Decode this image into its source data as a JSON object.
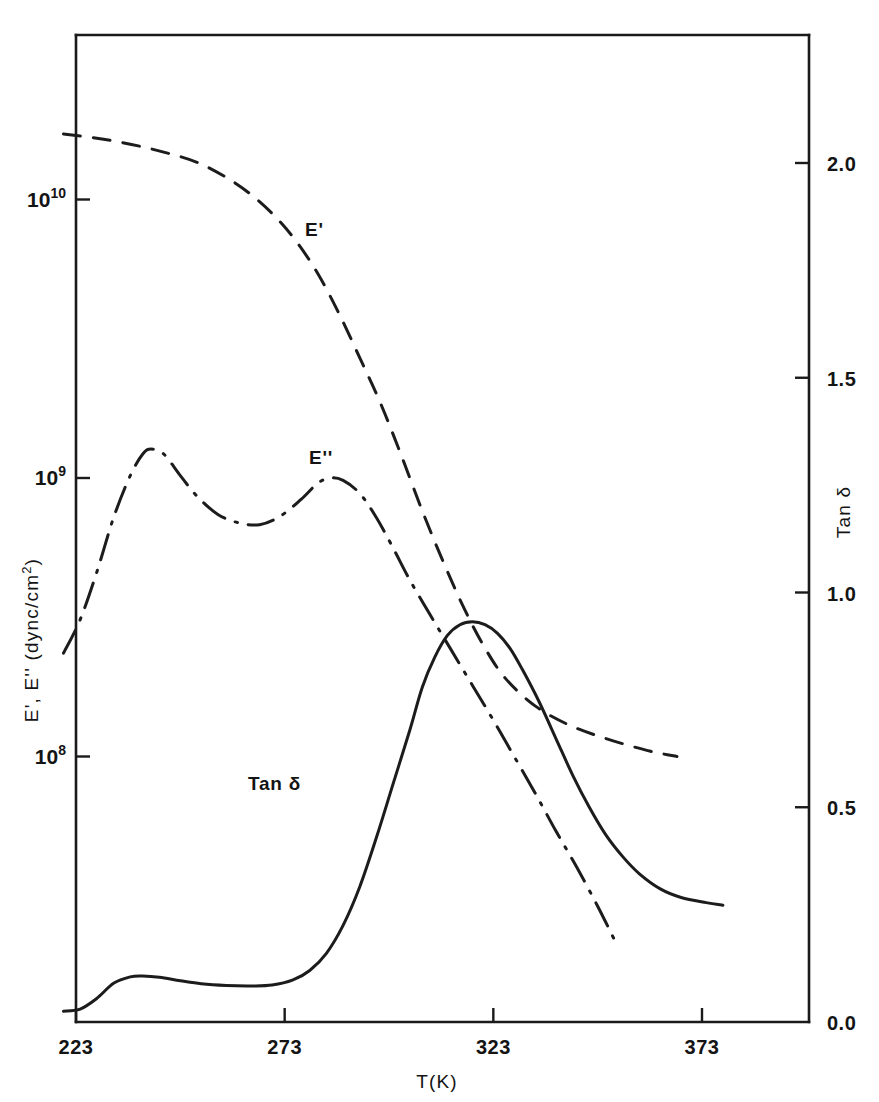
{
  "chart_data": {
    "type": "line",
    "title": "",
    "xlabel": "T(K)",
    "ylabel_left": "E', E'' (dync/cm2)",
    "ylabel_right": "Tan δ",
    "xlim": [
      218,
      394
    ],
    "x_ticks": [
      223,
      273,
      323,
      373
    ],
    "x_tick_labels": [
      "223",
      "273",
      "323",
      "373"
    ],
    "left_axis": {
      "scale": "log",
      "ylim": [
        10000000.0,
        35000000000.0
      ],
      "ticks": [
        10000000.0,
        100000000.0,
        1000000000.0,
        10000000000.0
      ],
      "tick_labels": [
        "10 7",
        "10 8",
        "10 9",
        "10 10"
      ],
      "tick_mantissas": [
        "10",
        "10",
        "10",
        "10"
      ],
      "tick_exponents": [
        "7",
        "8",
        "9",
        "10"
      ]
    },
    "right_axis": {
      "scale": "linear",
      "ylim": [
        0.0,
        2.3
      ],
      "ticks": [
        0.0,
        0.5,
        1.0,
        1.5,
        2.0
      ],
      "tick_labels": [
        "0.0",
        "0.5",
        "1.0",
        "1.5",
        "2.0"
      ]
    },
    "grid": false,
    "legend": "inline curve labels",
    "series": [
      {
        "name": "E'",
        "label": "E'",
        "axis": "left",
        "linestyle": "dashed",
        "label_x": 305,
        "label_y": 236,
        "points": [
          [
            220,
            17200000000.0
          ],
          [
            228,
            16600000000.0
          ],
          [
            236,
            15800000000.0
          ],
          [
            244,
            14800000000.0
          ],
          [
            252,
            13600000000.0
          ],
          [
            259,
            12000000000.0
          ],
          [
            265,
            10400000000.0
          ],
          [
            271,
            8600000000.0
          ],
          [
            276,
            7000000000.0
          ],
          [
            281,
            5400000000.0
          ],
          [
            286,
            3900000000.0
          ],
          [
            291,
            2700000000.0
          ],
          [
            296,
            1850000000.0
          ],
          [
            301,
            1200000000.0
          ],
          [
            306,
            760000000.0
          ],
          [
            311,
            500000000.0
          ],
          [
            316,
            340000000.0
          ],
          [
            321,
            245000000.0
          ],
          [
            326,
            190000000.0
          ],
          [
            333,
            152000000.0
          ],
          [
            341,
            130000000.0
          ],
          [
            350,
            116000000.0
          ],
          [
            360,
            105000000.0
          ],
          [
            367,
            100000000.0
          ]
        ]
      },
      {
        "name": "E''",
        "label": "E''",
        "axis": "left",
        "linestyle": "dash-dot",
        "label_x": 309,
        "label_y": 464,
        "points": [
          [
            220,
            235000000.0
          ],
          [
            224,
            310000000.0
          ],
          [
            228,
            460000000.0
          ],
          [
            232,
            720000000.0
          ],
          [
            236,
            1020000000.0
          ],
          [
            239,
            1220000000.0
          ],
          [
            241,
            1270000000.0
          ],
          [
            244,
            1220000000.0
          ],
          [
            248,
            1020000000.0
          ],
          [
            252,
            860000000.0
          ],
          [
            257,
            740000000.0
          ],
          [
            262,
            690000000.0
          ],
          [
            267,
            680000000.0
          ],
          [
            272,
            730000000.0
          ],
          [
            277,
            840000000.0
          ],
          [
            281,
            960000000.0
          ],
          [
            284,
            1000000000.0
          ],
          [
            287,
            980000000.0
          ],
          [
            291,
            880000000.0
          ],
          [
            295,
            720000000.0
          ],
          [
            299,
            560000000.0
          ],
          [
            303,
            430000000.0
          ],
          [
            308,
            320000000.0
          ],
          [
            313,
            240000000.0
          ],
          [
            318,
            180000000.0
          ],
          [
            323,
            135000000.0
          ],
          [
            328,
            100000000.0
          ],
          [
            333,
            74000000.0
          ],
          [
            338,
            54000000.0
          ],
          [
            343,
            40000000.0
          ],
          [
            348,
            29000000.0
          ],
          [
            352,
            22000000.0
          ]
        ]
      },
      {
        "name": "Tan δ",
        "label": "Tan δ",
        "axis": "right",
        "linestyle": "solid",
        "label_x": 248,
        "label_y": 790,
        "points": [
          [
            220,
            0.025
          ],
          [
            224,
            0.03
          ],
          [
            228,
            0.055
          ],
          [
            232,
            0.09
          ],
          [
            236,
            0.105
          ],
          [
            239,
            0.107
          ],
          [
            243,
            0.104
          ],
          [
            248,
            0.096
          ],
          [
            253,
            0.089
          ],
          [
            259,
            0.085
          ],
          [
            265,
            0.084
          ],
          [
            270,
            0.086
          ],
          [
            275,
            0.098
          ],
          [
            279,
            0.12
          ],
          [
            283,
            0.16
          ],
          [
            287,
            0.225
          ],
          [
            291,
            0.315
          ],
          [
            295,
            0.43
          ],
          [
            299,
            0.555
          ],
          [
            303,
            0.68
          ],
          [
            306,
            0.78
          ],
          [
            309,
            0.85
          ],
          [
            312,
            0.9
          ],
          [
            315,
            0.925
          ],
          [
            318,
            0.932
          ],
          [
            321,
            0.925
          ],
          [
            324,
            0.905
          ],
          [
            327,
            0.87
          ],
          [
            330,
            0.82
          ],
          [
            334,
            0.745
          ],
          [
            338,
            0.66
          ],
          [
            342,
            0.575
          ],
          [
            346,
            0.5
          ],
          [
            350,
            0.435
          ],
          [
            354,
            0.385
          ],
          [
            358,
            0.345
          ],
          [
            363,
            0.31
          ],
          [
            368,
            0.29
          ],
          [
            374,
            0.278
          ],
          [
            378,
            0.272
          ]
        ]
      }
    ]
  },
  "annotations": {
    "curve_label_e_prime": "E'",
    "curve_label_e_double_prime": "E''",
    "curve_label_tan_delta": "Tan δ"
  },
  "axes": {
    "x_title": "T(K)",
    "left_title_main": "E', E''  (dync/cm",
    "left_title_sup": "2",
    "left_title_close": ")",
    "right_title": "Tan δ"
  }
}
